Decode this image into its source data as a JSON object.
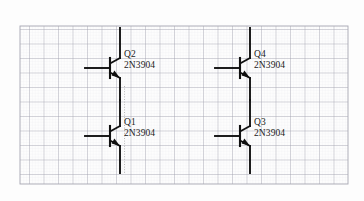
{
  "diagram": {
    "background_color": "#fdfdfd",
    "wire_color": "#111111",
    "label_color": "#1a1a1a",
    "grid": {
      "minor_color": "#e9e9ee",
      "major_color": "#a9a9b4",
      "minor_spacing": 2.9,
      "major_spacing": 14.5,
      "origin_x": 20,
      "origin_y": 26,
      "width": 328,
      "height": 158
    },
    "dotted_line": {
      "color": "#b9b9b9",
      "x": 124,
      "y_top": 86,
      "y_bottom": 174
    }
  },
  "transistors": [
    {
      "id": "Q2",
      "ref": "Q2",
      "part": "2N3904",
      "type": "npn",
      "label_x": 124,
      "label_y": 50,
      "body_x": 120,
      "base_bar_top": 54,
      "base_bar_bottom": 82,
      "base_lead_x": 85,
      "base_y": 68,
      "collector_top": 28,
      "emitter_bottom": 100
    },
    {
      "id": "Q1",
      "ref": "Q1",
      "part": "2N3904",
      "type": "npn",
      "label_x": 124,
      "label_y": 118,
      "body_x": 120,
      "base_bar_top": 122,
      "base_bar_bottom": 150,
      "base_lead_x": 85,
      "base_y": 136,
      "collector_top": 100,
      "emitter_bottom": 173
    },
    {
      "id": "Q4",
      "ref": "Q4",
      "part": "2N3904",
      "type": "npn",
      "label_x": 254,
      "label_y": 50,
      "body_x": 250,
      "base_bar_top": 54,
      "base_bar_bottom": 82,
      "base_lead_x": 215,
      "base_y": 68,
      "collector_top": 28,
      "emitter_bottom": 100
    },
    {
      "id": "Q3",
      "ref": "Q3",
      "part": "2N3904",
      "type": "npn",
      "label_x": 254,
      "label_y": 118,
      "body_x": 250,
      "base_bar_top": 122,
      "base_bar_bottom": 150,
      "base_lead_x": 215,
      "base_y": 136,
      "collector_top": 100,
      "emitter_bottom": 173
    }
  ]
}
